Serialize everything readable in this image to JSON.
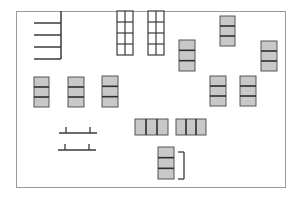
{
  "diagram": {
    "type": "floor-plan",
    "colors": {
      "background": "#ffffff",
      "frame": "#9a9a9a",
      "line": "#3a3a3a",
      "block_fill": "#c8c8c8",
      "block_stroke": "#555555",
      "divider": "#2e2e2e"
    },
    "frame": {
      "x": 16,
      "y": 11,
      "w": 269,
      "h": 176
    },
    "comb": {
      "spine": {
        "x": 61,
        "y1": 11,
        "y2": 59
      },
      "teeth_y": [
        23,
        35,
        47,
        59
      ],
      "teeth_x1": 34
    },
    "ladder_grids": [
      {
        "x": 117,
        "y": 11,
        "w": 16,
        "h": 44,
        "cols": 2,
        "rows": 4
      },
      {
        "x": 148,
        "y": 11,
        "w": 16,
        "h": 44,
        "cols": 2,
        "rows": 4
      }
    ],
    "vertical_blocks": [
      {
        "x": 34,
        "y": 77,
        "w": 15,
        "h": 30,
        "cells": 3
      },
      {
        "x": 68,
        "y": 77,
        "w": 16,
        "h": 30,
        "cells": 3
      },
      {
        "x": 102,
        "y": 76,
        "w": 16,
        "h": 31,
        "cells": 3
      },
      {
        "x": 179,
        "y": 40,
        "w": 16,
        "h": 31,
        "cells": 3
      },
      {
        "x": 220,
        "y": 16,
        "w": 15,
        "h": 30,
        "cells": 3
      },
      {
        "x": 261,
        "y": 41,
        "w": 16,
        "h": 30,
        "cells": 3
      },
      {
        "x": 210,
        "y": 76,
        "w": 16,
        "h": 30,
        "cells": 3
      },
      {
        "x": 240,
        "y": 76,
        "w": 16,
        "h": 30,
        "cells": 3
      },
      {
        "x": 158,
        "y": 147,
        "w": 16,
        "h": 32,
        "cells": 3
      }
    ],
    "horizontal_blocks": [
      {
        "x": 135,
        "y": 119,
        "w": 33,
        "h": 16,
        "cells": 3
      },
      {
        "x": 176,
        "y": 119,
        "w": 30,
        "h": 16,
        "cells": 3
      }
    ],
    "bracket": {
      "x": 184,
      "y1": 152,
      "y2": 179,
      "tick_len": 6
    },
    "benches": [
      {
        "y": 133,
        "x1": 59,
        "x2": 97,
        "ticks_x": [
          66,
          90
        ],
        "tick_h": 6
      },
      {
        "y": 150,
        "x1": 58,
        "x2": 96,
        "ticks_x": [
          65,
          89
        ],
        "tick_h": 6
      }
    ]
  }
}
